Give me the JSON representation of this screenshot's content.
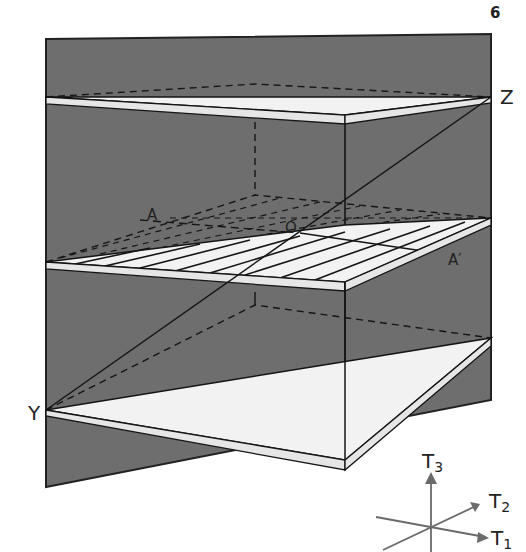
{
  "page": {
    "number": "6"
  },
  "colors": {
    "panel": "#6e6e6e",
    "plane": "#f2f2f2",
    "line": "#151515",
    "axis": "#6a6a6a"
  },
  "labels": {
    "Z": "Z",
    "Y": "Y",
    "A": "A",
    "A_prime": "A′",
    "O": "O"
  },
  "axes": {
    "T1": {
      "base": "T",
      "sub": "1"
    },
    "T2": {
      "base": "T",
      "sub": "2"
    },
    "T3": {
      "base": "T",
      "sub": "3"
    }
  },
  "planes": [
    {
      "name": "upper-plane",
      "hatched": false
    },
    {
      "name": "middle-plane",
      "hatched": true
    },
    {
      "name": "lower-plane",
      "hatched": false
    }
  ]
}
